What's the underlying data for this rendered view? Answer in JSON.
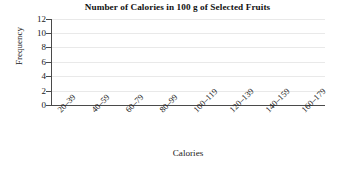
{
  "chart_data": {
    "type": "bar",
    "title": "Number of Calories in 100 g of Selected Fruits",
    "xlabel": "Calories",
    "ylabel": "Frequency",
    "categories": [
      "20–39",
      "40–59",
      "60–79",
      "80–99",
      "100–119",
      "120–139",
      "140–159",
      "160–179"
    ],
    "values": [
      0,
      0,
      0,
      0,
      0,
      0,
      0,
      0
    ],
    "ylim": [
      0,
      12
    ],
    "ytick_step": 2,
    "yticks": [
      "12",
      "10",
      "8",
      "6",
      "4",
      "2",
      "0"
    ],
    "ytick_values": [
      12,
      10,
      8,
      6,
      4,
      2,
      0
    ],
    "grid": true,
    "grid_axis": "y",
    "legend": "none",
    "xtick_rotation": -45,
    "note": "empty plot area — no bars drawn",
    "colors": {
      "axis": "#4a4a4a",
      "grid": "#e9e9e9",
      "text": "#1a1a1a",
      "background": "#ffffff",
      "bar": "#7a7a7a"
    }
  }
}
